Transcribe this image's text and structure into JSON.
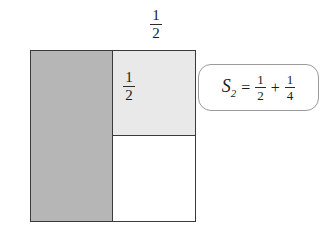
{
  "figure": {
    "name": "partial-sum-unit-square-diagram",
    "caption_absent": true
  },
  "labels": {
    "top": {
      "numerator": "1",
      "denominator": "2"
    },
    "inner": {
      "numerator": "1",
      "denominator": "2"
    }
  },
  "equation": {
    "symbol": "S",
    "subscript": "2",
    "equals": "=",
    "plus": "+",
    "term1": {
      "numerator": "1",
      "denominator": "2"
    },
    "term2": {
      "numerator": "1",
      "denominator": "4"
    },
    "plain_text": "S_2 = 1/2 + 1/4"
  },
  "regions": {
    "half": {
      "value": "1/2",
      "fill": "#b6b6b6"
    },
    "quarter": {
      "value": "1/4",
      "fill": "#e9e9e9"
    },
    "remainder": {
      "value": "1/4",
      "fill": "#ffffff"
    }
  },
  "colors": {
    "outline": "#3a3a3a",
    "callout_border": "#9a9a9a",
    "text": "#1c1c1c",
    "background": "#ffffff"
  },
  "chart_data": {
    "type": "area",
    "title": "",
    "xlabel": "",
    "ylabel": "",
    "categories": [
      "1/2",
      "1/4",
      "unshaded 1/4"
    ],
    "values": [
      0.5,
      0.25,
      0.25
    ],
    "annotations": [
      "1/2",
      "1/2",
      "S_2 = 1/2 + 1/4"
    ],
    "grid": false,
    "legend": "none"
  }
}
